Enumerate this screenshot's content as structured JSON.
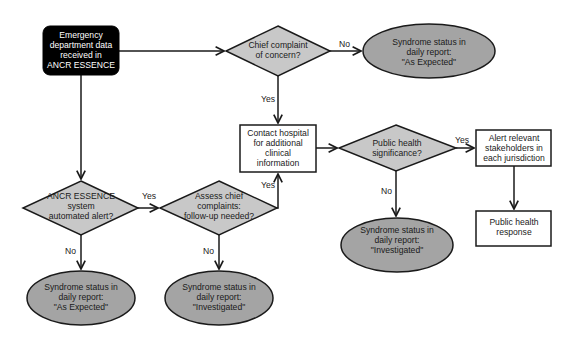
{
  "colors": {
    "start_fill": "#000000",
    "decision_fill": "#c8c8c8",
    "outcome_fill": "#a4a4a4",
    "process_fill": "#ffffff",
    "stroke": "#1a1a1a"
  },
  "nodes": {
    "start": {
      "type": "start",
      "lines": [
        "Emergency",
        "department data",
        "received in",
        "ANCR ESSENCE"
      ]
    },
    "chief_complaint": {
      "type": "decision",
      "lines": [
        "Chief complaint",
        "of concern?"
      ]
    },
    "status_expected_top": {
      "type": "outcome",
      "lines": [
        "Syndrome status in",
        "daily report:",
        "\"As Expected\""
      ]
    },
    "contact_hospital": {
      "type": "process",
      "lines": [
        "Contact hospital",
        "for additional",
        "clinical",
        "information"
      ]
    },
    "public_health_significance": {
      "type": "decision",
      "lines": [
        "Public health",
        "significance?"
      ]
    },
    "alert_stakeholders": {
      "type": "process",
      "lines": [
        "Alert relevant",
        "stakeholders in",
        "each jurisdiction"
      ]
    },
    "public_health_response": {
      "type": "process",
      "lines": [
        "Public health",
        "response"
      ]
    },
    "status_investigated_right": {
      "type": "outcome",
      "lines": [
        "Syndrome status in",
        "daily report:",
        "\"Investigated\""
      ]
    },
    "automated_alert": {
      "type": "decision",
      "lines": [
        "ANCR ESSENCE",
        "system",
        "automated alert?"
      ]
    },
    "assess_complaints": {
      "type": "decision",
      "lines": [
        "Assess chief",
        "complaints:",
        "follow-up needed?"
      ]
    },
    "status_expected_bottom": {
      "type": "outcome",
      "lines": [
        "Syndrome status in",
        "daily report:",
        "\"As Expected\""
      ]
    },
    "status_investigated_bottom": {
      "type": "outcome",
      "lines": [
        "Syndrome status in",
        "daily report:",
        "\"Investigated\""
      ]
    }
  },
  "edge_labels": {
    "chief_no": "No",
    "chief_yes": "Yes",
    "public_yes": "Yes",
    "public_no": "No",
    "alert_yes": "Yes",
    "alert_no": "No",
    "assess_yes": "Yes",
    "assess_no": "No"
  }
}
